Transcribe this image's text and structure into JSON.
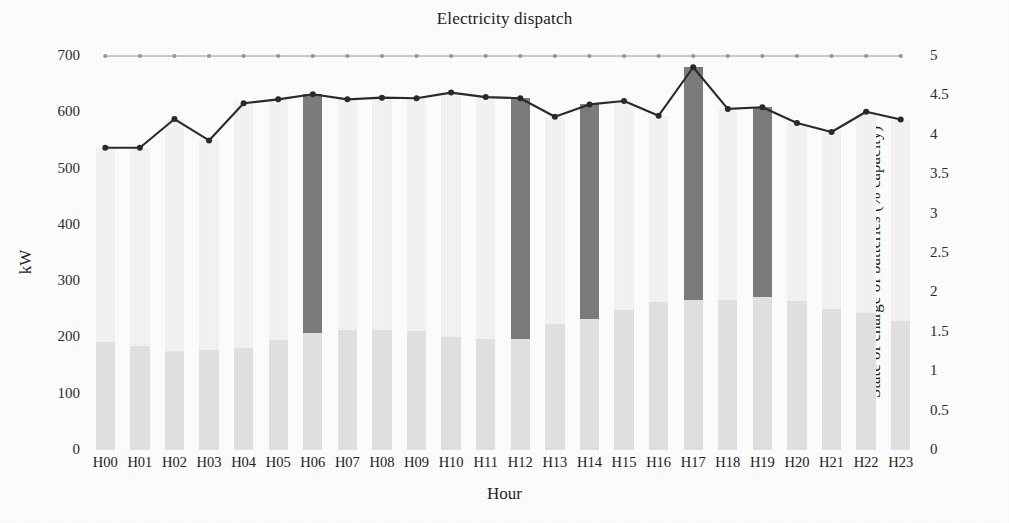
{
  "chart_data": {
    "type": "bar",
    "title": "Electricity dispatch",
    "xlabel": "Hour",
    "ylabel": "kW",
    "ylabel_right": "State of charge of batteries (% capacity)",
    "grid": false,
    "legend": "none",
    "ylim": [
      0,
      700
    ],
    "ylim_right": [
      0,
      5
    ],
    "yticks": [
      "700",
      "600",
      "500",
      "400",
      "300",
      "200",
      "100",
      "0"
    ],
    "ytick_values": [
      700,
      600,
      500,
      400,
      300,
      200,
      100,
      0
    ],
    "yticks_right": [
      "5",
      "4.5",
      "4",
      "3.5",
      "3",
      "2.5",
      "2",
      "1.5",
      "1",
      "0.5",
      "0"
    ],
    "ytick_values_right": [
      5,
      4.5,
      4,
      3.5,
      3,
      2.5,
      2,
      1.5,
      1,
      0.5,
      0
    ],
    "categories": [
      "H00",
      "H01",
      "H02",
      "H03",
      "H04",
      "H05",
      "H06",
      "H07",
      "H08",
      "H09",
      "H10",
      "H11",
      "H12",
      "H13",
      "H14",
      "H15",
      "H16",
      "H17",
      "H18",
      "H19",
      "H20",
      "H21",
      "H22",
      "H23"
    ],
    "series": [
      {
        "name": "Base generation",
        "kind": "bar",
        "color": "#e3e3e3",
        "axis": "left",
        "values": [
          192,
          184,
          176,
          177,
          181,
          196,
          207,
          213,
          214,
          211,
          200,
          197,
          198,
          223,
          233,
          249,
          263,
          266,
          266,
          271,
          265,
          251,
          243,
          229
        ]
      },
      {
        "name": "Dispatch total",
        "kind": "bar",
        "color": "#f5f5f5",
        "axis": "left",
        "values": [
          537,
          537,
          588,
          550,
          616,
          623,
          632,
          623,
          626,
          625,
          635,
          627,
          625,
          592,
          614,
          620,
          594,
          680,
          606,
          609,
          581,
          565,
          601,
          587
        ]
      },
      {
        "name": "Battery discharge",
        "kind": "bar",
        "color": "#7d7d7d",
        "axis": "left",
        "values": [
          0,
          0,
          0,
          0,
          0,
          0,
          425,
          0,
          0,
          0,
          0,
          0,
          427,
          0,
          381,
          0,
          0,
          414,
          0,
          338,
          0,
          0,
          0,
          0
        ]
      },
      {
        "name": "Demand",
        "kind": "line",
        "color": "#2b2b2b",
        "axis": "left",
        "marker": "circle",
        "values": [
          537,
          537,
          588,
          550,
          616,
          623,
          632,
          623,
          626,
          625,
          635,
          627,
          625,
          592,
          614,
          620,
          594,
          680,
          606,
          609,
          581,
          565,
          601,
          587
        ]
      },
      {
        "name": "State of charge of batteries",
        "kind": "line",
        "color": "#9a9a9a",
        "axis": "right",
        "marker": "circle",
        "values": [
          5,
          5,
          5,
          5,
          5,
          5,
          5,
          5,
          5,
          5,
          5,
          5,
          5,
          5,
          5,
          5,
          5,
          5,
          5,
          5,
          5,
          5,
          5,
          5
        ]
      }
    ]
  }
}
